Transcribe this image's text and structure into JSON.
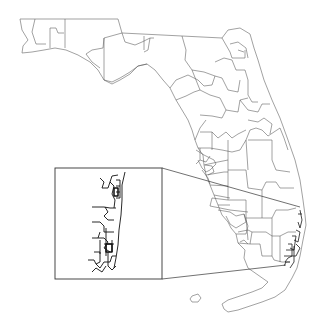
{
  "map": {
    "subject": "Florida district boundaries",
    "inset": {
      "label": "Southeast Florida coastal detail",
      "box": {
        "x": 55,
        "y": 168,
        "width": 107,
        "height": 111
      }
    },
    "colors": {
      "background": "#ffffff",
      "outline": "#7a7a7a",
      "boundaries": "#555555",
      "inset_lines": "#111111"
    }
  }
}
